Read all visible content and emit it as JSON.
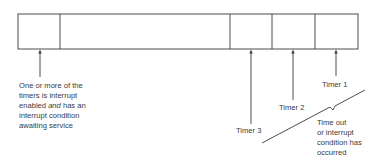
{
  "diagram": {
    "type": "register-bit-field",
    "fields": [
      {
        "name": "interrupt-pending-bit",
        "x_start": 18,
        "x_end": 60
      },
      {
        "name": "unused",
        "x_start": 60,
        "x_end": 230
      },
      {
        "name": "timer-3-bit",
        "x_start": 230,
        "x_end": 272
      },
      {
        "name": "timer-2-bit",
        "x_start": 272,
        "x_end": 315
      },
      {
        "name": "timer-1-bit",
        "x_start": 315,
        "x_end": 358
      }
    ],
    "labels": {
      "pending": {
        "line1": "One or more of the",
        "line2": "timers is interrupt",
        "line3_prefix": "enabled ",
        "line3_em": "and",
        "line3_suffix": " has an",
        "line4": "interrupt condition",
        "line5": "awaiting service"
      },
      "timer1": "Timer 1",
      "timer2": "Timer 2",
      "timer3": "Timer 3",
      "timeout": {
        "line1": "Time out",
        "line2": "or interrupt",
        "line3": "condition has",
        "line4": "occurred"
      }
    },
    "colors": {
      "line": "#3a3a3a",
      "text": "#3a3a3a",
      "background": "#ffffff"
    }
  }
}
